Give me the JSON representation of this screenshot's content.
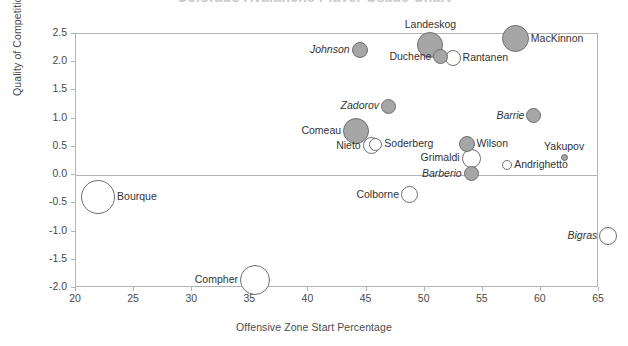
{
  "chart_data": {
    "type": "scatter",
    "title": "Colorado Avalanche Player Usage Chart",
    "xlabel": "Offensive Zone Start Percentage",
    "ylabel": "Quality of Competition",
    "xlim": [
      20,
      65
    ],
    "ylim": [
      -2.0,
      2.5
    ],
    "xticks": [
      "20",
      "25",
      "30",
      "35",
      "40",
      "45",
      "50",
      "55",
      "60",
      "65"
    ],
    "xtick_values": [
      20,
      25,
      30,
      35,
      40,
      45,
      50,
      55,
      60,
      65
    ],
    "yticks": [
      "2.5",
      "2.0",
      "1.5",
      "1.0",
      "0.5",
      "0.0",
      "-0.5",
      "-1.0",
      "-1.5",
      "-2.0"
    ],
    "ytick_values": [
      2.5,
      2.0,
      1.5,
      1.0,
      0.5,
      0.0,
      -0.5,
      -1.0,
      -1.5,
      -2.0
    ],
    "grid": false,
    "legend": "none",
    "zero_line": true,
    "bubble_fill_positive": "#a6a6a6",
    "bubble_fill_negative": "#ffffff",
    "bubble_stroke": "#6e6e6e",
    "frame_color": "#b4b4b4",
    "points": [
      {
        "name": "Johnson",
        "x": 44.4,
        "y": 2.22,
        "r": 8.0,
        "fill": "gray",
        "italic": true,
        "label_pos": "left"
      },
      {
        "name": "Landeskog",
        "x": 50.5,
        "y": 2.3,
        "r": 13.0,
        "fill": "gray",
        "italic": false,
        "label_pos": "top"
      },
      {
        "name": "Duchene",
        "x": 51.4,
        "y": 2.1,
        "r": 7.5,
        "fill": "gray",
        "italic": false,
        "label_pos": "left"
      },
      {
        "name": "Rantanen",
        "x": 52.4,
        "y": 2.08,
        "r": 8.0,
        "fill": "white",
        "italic": false,
        "label_pos": "right"
      },
      {
        "name": "MacKinnon",
        "x": 57.8,
        "y": 2.42,
        "r": 13.5,
        "fill": "gray",
        "italic": false,
        "label_pos": "right"
      },
      {
        "name": "Zadorov",
        "x": 46.9,
        "y": 1.22,
        "r": 7.5,
        "fill": "gray",
        "italic": true,
        "label_pos": "left"
      },
      {
        "name": "Barrie",
        "x": 59.4,
        "y": 1.05,
        "r": 7.5,
        "fill": "gray",
        "italic": true,
        "label_pos": "left"
      },
      {
        "name": "Comeau",
        "x": 44.1,
        "y": 0.78,
        "r": 13.0,
        "fill": "gray",
        "italic": false,
        "label_pos": "left"
      },
      {
        "name": "Nieto",
        "x": 45.4,
        "y": 0.52,
        "r": 8.5,
        "fill": "white",
        "italic": false,
        "label_pos": "left"
      },
      {
        "name": "Soderberg",
        "x": 45.8,
        "y": 0.55,
        "r": 6.5,
        "fill": "white",
        "italic": false,
        "label_pos": "right"
      },
      {
        "name": "Wilson",
        "x": 53.6,
        "y": 0.56,
        "r": 8.0,
        "fill": "gray",
        "italic": false,
        "label_pos": "right"
      },
      {
        "name": "Grimaldi",
        "x": 54.0,
        "y": 0.3,
        "r": 9.5,
        "fill": "white",
        "italic": false,
        "label_pos": "left"
      },
      {
        "name": "Yakupov",
        "x": 62.0,
        "y": 0.31,
        "r": 3.5,
        "fill": "gray",
        "italic": false,
        "label_pos": "top"
      },
      {
        "name": "Andrighetto",
        "x": 57.1,
        "y": 0.18,
        "r": 5.0,
        "fill": "white",
        "italic": false,
        "label_pos": "right"
      },
      {
        "name": "Barberio",
        "x": 54.0,
        "y": 0.02,
        "r": 7.5,
        "fill": "gray",
        "italic": true,
        "label_pos": "left"
      },
      {
        "name": "Bourque",
        "x": 21.9,
        "y": -0.38,
        "r": 17.0,
        "fill": "white",
        "italic": false,
        "label_pos": "right"
      },
      {
        "name": "Colborne",
        "x": 48.7,
        "y": -0.35,
        "r": 8.5,
        "fill": "white",
        "italic": false,
        "label_pos": "left"
      },
      {
        "name": "Bigras",
        "x": 65.8,
        "y": -1.07,
        "r": 9.0,
        "fill": "white",
        "italic": true,
        "label_pos": "left"
      },
      {
        "name": "Compher",
        "x": 35.4,
        "y": -1.86,
        "r": 15.0,
        "fill": "white",
        "italic": false,
        "label_pos": "left"
      }
    ]
  }
}
